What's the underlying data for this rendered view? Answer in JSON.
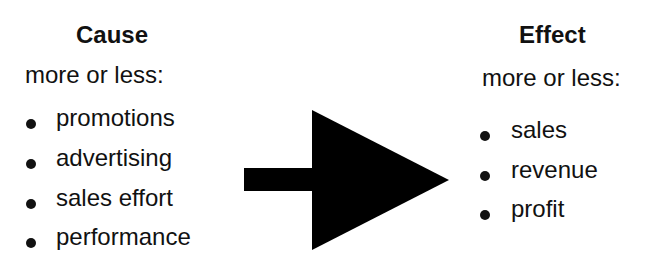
{
  "cause": {
    "title": "Cause",
    "subtitle": "more or less:",
    "items": [
      "promotions",
      "advertising",
      "sales effort",
      "performance"
    ]
  },
  "effect": {
    "title": "Effect",
    "subtitle": "more or less:",
    "items": [
      "sales",
      "revenue",
      "profit"
    ]
  },
  "arrow": {
    "direction": "right",
    "color": "#000000",
    "icon": "arrow-right-icon"
  }
}
